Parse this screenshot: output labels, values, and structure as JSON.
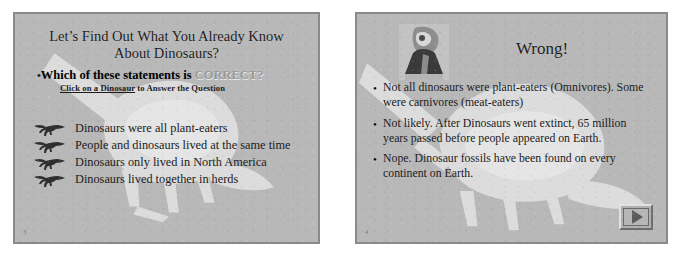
{
  "page": {
    "background_color": "#ffffff",
    "slide_background_color": "#b8b8b8",
    "slide_border_color": "#8a8a8a",
    "body_text_color": "#1b1b1b",
    "muted_text_color": "#9a9a9a"
  },
  "slide_left": {
    "number": "3",
    "title": "Let’s Find Out What You Already Know About Dinosaurs?",
    "title_line1": "Let’s Find Out What You Already Know",
    "title_line2": "About Dinosaurs?",
    "bullet_glyph": "•",
    "question_prefix": "Which of these statements is ",
    "question_emphasis": "CORRECT?",
    "subtitle_link": "Click on a Dinosaur",
    "subtitle_rest": " to Answer the Question",
    "answers": [
      {
        "icon": "dinosaur-icon",
        "text": "Dinosaurs were all plant-eaters"
      },
      {
        "icon": "dinosaur-icon",
        "text": "People and dinosaurs lived at the same time"
      },
      {
        "icon": "dinosaur-icon",
        "text": "Dinosaurs only lived in North America"
      },
      {
        "icon": "dinosaur-icon",
        "text": "Dinosaurs lived together in herds"
      }
    ]
  },
  "slide_right": {
    "number": "4",
    "title": "Wrong!",
    "image": "dinosaur-head-photo",
    "bullet_glyph": "•",
    "bullets": [
      "Not all dinosaurs were plant-eaters (Omnivores). Some were carnivores (meat-eaters)",
      "Not likely. After Dinosaurs went extinct, 65 million years passed before people appeared on Earth.",
      "Nope. Dinosaur fossils have been found on every continent on Earth."
    ],
    "next_button": {
      "icon": "play-triangle-icon",
      "label": ""
    }
  }
}
